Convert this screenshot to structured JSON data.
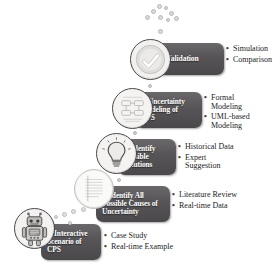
{
  "figure": {
    "box_color": "#575557",
    "text_color": "#ffffff",
    "bullet_text_color": "#1b1b1b",
    "background": "#ffffff"
  },
  "bubbles": {
    "name": "bubble-cluster",
    "count": 9
  },
  "steps": [
    {
      "number": "1",
      "icon": "robot-icon",
      "title": "1. Interactive\nScenario of\nCPS",
      "bullets": [
        "Case Study",
        "Real-time Example"
      ]
    },
    {
      "number": "2",
      "icon": "document-list-icon",
      "title": "2. Identify All\nPossible Causes of\nUncertainty",
      "bullets": [
        "Literature Review",
        "Real-time Data"
      ]
    },
    {
      "number": "3",
      "icon": "lightbulb-icon",
      "title": "3. Identify\nPossible\nSolutions",
      "bullets": [
        "Historical Data",
        "Expert\nSuggestion"
      ]
    },
    {
      "number": "4",
      "icon": "formal-model-icon",
      "title": "4. Uncertainty\nModeling of\nCPS",
      "bullets": [
        "Formal\nModeling",
        "UML-based\nModeling"
      ]
    },
    {
      "number": "5",
      "icon": "check-circle-icon",
      "title": "5. Validation",
      "bullets": [
        "Simulation",
        "Comparison"
      ]
    }
  ],
  "bullet_marker": "•"
}
